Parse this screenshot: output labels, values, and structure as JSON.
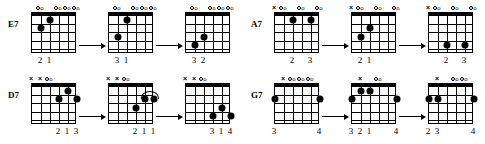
{
  "page": {
    "background_color": "#ffffff",
    "ink_color": "#000000"
  },
  "legend": {
    "open_symbol": "o",
    "muted_symbol": "×",
    "strings_count": 6,
    "frets_count": 5
  },
  "blocks": [
    {
      "id": "e7",
      "label": "E7",
      "diagrams": [
        {
          "markers": [
            {
              "string": 6,
              "symbol": ""
            },
            {
              "string": 5,
              "symbol": "o"
            },
            {
              "string": 4,
              "symbol": ""
            },
            {
              "string": 3,
              "symbol": "o"
            },
            {
              "string": 2,
              "symbol": "o"
            },
            {
              "string": 1,
              "symbol": "o"
            }
          ],
          "dots": [
            {
              "string": 5,
              "fret": 2
            },
            {
              "string": 4,
              "fret": 1
            }
          ],
          "fingers": [
            {
              "string": 5,
              "number": "2"
            },
            {
              "string": 4,
              "number": "1"
            }
          ],
          "barre": null
        },
        {
          "markers": [
            {
              "string": 6,
              "symbol": ""
            },
            {
              "string": 5,
              "symbol": "o"
            },
            {
              "string": 4,
              "symbol": ""
            },
            {
              "string": 3,
              "symbol": "o"
            },
            {
              "string": 2,
              "symbol": "o"
            },
            {
              "string": 1,
              "symbol": "o"
            }
          ],
          "dots": [
            {
              "string": 5,
              "fret": 3
            },
            {
              "string": 4,
              "fret": 1
            }
          ],
          "fingers": [
            {
              "string": 5,
              "number": "3"
            },
            {
              "string": 4,
              "number": "1"
            }
          ],
          "barre": null
        },
        {
          "markers": [
            {
              "string": 6,
              "symbol": ""
            },
            {
              "string": 5,
              "symbol": "o"
            },
            {
              "string": 4,
              "symbol": ""
            },
            {
              "string": 3,
              "symbol": "o"
            },
            {
              "string": 2,
              "symbol": "o"
            },
            {
              "string": 1,
              "symbol": "o"
            }
          ],
          "dots": [
            {
              "string": 5,
              "fret": 4
            },
            {
              "string": 4,
              "fret": 3
            }
          ],
          "fingers": [
            {
              "string": 5,
              "number": "3"
            },
            {
              "string": 4,
              "number": "2"
            }
          ],
          "barre": null
        }
      ]
    },
    {
      "id": "a7",
      "label": "A7",
      "diagrams": [
        {
          "markers": [
            {
              "string": 6,
              "symbol": "×"
            },
            {
              "string": 5,
              "symbol": "o"
            },
            {
              "string": 4,
              "symbol": ""
            },
            {
              "string": 3,
              "symbol": "o"
            },
            {
              "string": 2,
              "symbol": ""
            },
            {
              "string": 1,
              "symbol": "o"
            }
          ],
          "dots": [
            {
              "string": 4,
              "fret": 1
            },
            {
              "string": 2,
              "fret": 1
            }
          ],
          "fingers": [
            {
              "string": 4,
              "number": "2"
            },
            {
              "string": 2,
              "number": "3"
            }
          ],
          "barre": null
        },
        {
          "markers": [
            {
              "string": 6,
              "symbol": "×"
            },
            {
              "string": 5,
              "symbol": "o"
            },
            {
              "string": 4,
              "symbol": ""
            },
            {
              "string": 3,
              "symbol": "o"
            },
            {
              "string": 2,
              "symbol": ""
            },
            {
              "string": 1,
              "symbol": "o"
            }
          ],
          "dots": [
            {
              "string": 5,
              "fret": 3
            },
            {
              "string": 4,
              "fret": 2
            }
          ],
          "fingers": [
            {
              "string": 5,
              "number": "2"
            },
            {
              "string": 4,
              "number": "1"
            }
          ],
          "barre": null
        },
        {
          "markers": [
            {
              "string": 6,
              "symbol": "×"
            },
            {
              "string": 5,
              "symbol": "o"
            },
            {
              "string": 4,
              "symbol": ""
            },
            {
              "string": 3,
              "symbol": "o"
            },
            {
              "string": 2,
              "symbol": ""
            },
            {
              "string": 1,
              "symbol": "o"
            }
          ],
          "dots": [
            {
              "string": 4,
              "fret": 4
            },
            {
              "string": 2,
              "fret": 4
            }
          ],
          "fingers": [
            {
              "string": 4,
              "number": "2"
            },
            {
              "string": 2,
              "number": "3"
            }
          ],
          "barre": null
        }
      ]
    },
    {
      "id": "d7",
      "label": "D7",
      "diagrams": [
        {
          "markers": [
            {
              "string": 6,
              "symbol": "×"
            },
            {
              "string": 5,
              "symbol": "×"
            },
            {
              "string": 4,
              "symbol": "o"
            },
            {
              "string": 3,
              "symbol": ""
            },
            {
              "string": 2,
              "symbol": ""
            },
            {
              "string": 1,
              "symbol": ""
            }
          ],
          "dots": [
            {
              "string": 3,
              "fret": 2
            },
            {
              "string": 2,
              "fret": 1
            },
            {
              "string": 1,
              "fret": 2
            }
          ],
          "fingers": [
            {
              "string": 3,
              "number": "2"
            },
            {
              "string": 2,
              "number": "1"
            },
            {
              "string": 1,
              "number": "3"
            }
          ],
          "barre": null
        },
        {
          "markers": [
            {
              "string": 6,
              "symbol": "×"
            },
            {
              "string": 5,
              "symbol": "×"
            },
            {
              "string": 4,
              "symbol": "o"
            },
            {
              "string": 3,
              "symbol": ""
            },
            {
              "string": 2,
              "symbol": ""
            },
            {
              "string": 1,
              "symbol": ""
            }
          ],
          "dots": [
            {
              "string": 3,
              "fret": 3
            },
            {
              "string": 2,
              "fret": 2
            },
            {
              "string": 1,
              "fret": 2
            }
          ],
          "fingers": [
            {
              "string": 3,
              "number": "2"
            },
            {
              "string": 2,
              "number": "1"
            },
            {
              "string": 1,
              "number": "1"
            }
          ],
          "barre": {
            "fret": 2,
            "from_string": 2,
            "to_string": 1
          }
        },
        {
          "markers": [
            {
              "string": 6,
              "symbol": "×"
            },
            {
              "string": 5,
              "symbol": "×"
            },
            {
              "string": 4,
              "symbol": "o"
            },
            {
              "string": 3,
              "symbol": ""
            },
            {
              "string": 2,
              "symbol": ""
            },
            {
              "string": 1,
              "symbol": ""
            }
          ],
          "dots": [
            {
              "string": 3,
              "fret": 4
            },
            {
              "string": 2,
              "fret": 3
            },
            {
              "string": 1,
              "fret": 4
            }
          ],
          "fingers": [
            {
              "string": 3,
              "number": "3"
            },
            {
              "string": 2,
              "number": "1"
            },
            {
              "string": 1,
              "number": "4"
            }
          ],
          "barre": null
        }
      ]
    },
    {
      "id": "g7",
      "label": "G7",
      "diagrams": [
        {
          "markers": [
            {
              "string": 6,
              "symbol": ""
            },
            {
              "string": 5,
              "symbol": "×"
            },
            {
              "string": 4,
              "symbol": "o"
            },
            {
              "string": 3,
              "symbol": "o"
            },
            {
              "string": 2,
              "symbol": "o"
            },
            {
              "string": 1,
              "symbol": ""
            }
          ],
          "dots": [
            {
              "string": 6,
              "fret": 2
            },
            {
              "string": 1,
              "fret": 2
            }
          ],
          "fingers": [
            {
              "string": 6,
              "number": "3"
            },
            {
              "string": 1,
              "number": "4"
            }
          ],
          "barre": null
        },
        {
          "markers": [
            {
              "string": 6,
              "symbol": ""
            },
            {
              "string": 5,
              "symbol": "×"
            },
            {
              "string": 4,
              "symbol": ""
            },
            {
              "string": 3,
              "symbol": "o"
            },
            {
              "string": 2,
              "symbol": ""
            },
            {
              "string": 1,
              "symbol": ""
            }
          ],
          "dots": [
            {
              "string": 6,
              "fret": 2
            },
            {
              "string": 5,
              "fret": 1
            },
            {
              "string": 4,
              "fret": 0
            },
            {
              "string": 1,
              "fret": 2
            }
          ],
          "fingers": [
            {
              "string": 6,
              "number": "3"
            },
            {
              "string": 5,
              "number": "2"
            },
            {
              "string": 4,
              "number": "1"
            },
            {
              "string": 1,
              "number": "4"
            }
          ],
          "barre": null
        },
        {
          "markers": [
            {
              "string": 6,
              "symbol": ""
            },
            {
              "string": 5,
              "symbol": "×"
            },
            {
              "string": 4,
              "symbol": ""
            },
            {
              "string": 3,
              "symbol": "o"
            },
            {
              "string": 2,
              "symbol": "o"
            },
            {
              "string": 1,
              "symbol": ""
            }
          ],
          "dots": [
            {
              "string": 6,
              "fret": 2
            },
            {
              "string": 5,
              "fret": 2
            },
            {
              "string": 1,
              "fret": 2
            }
          ],
          "fingers": [
            {
              "string": 6,
              "number": "2"
            },
            {
              "string": 5,
              "number": "3"
            },
            {
              "string": 1,
              "number": "4"
            }
          ],
          "barre": null
        }
      ]
    }
  ],
  "arrow": {
    "symbol": "→",
    "name": "right-arrow"
  }
}
